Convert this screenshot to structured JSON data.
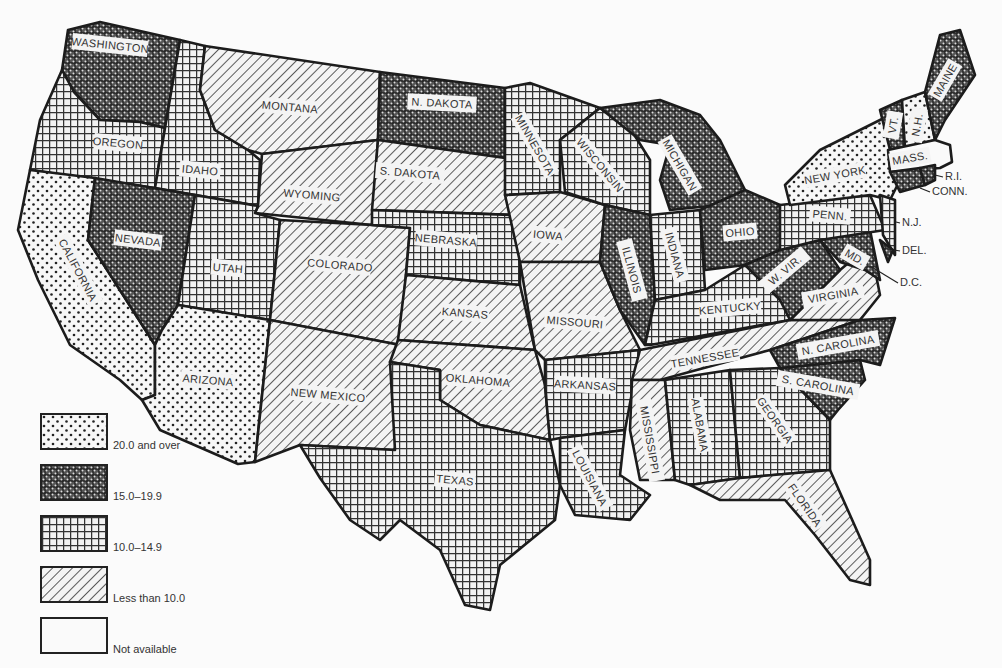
{
  "map": {
    "region": "United States (48 contiguous states + D.C.)",
    "classes": [
      {
        "id": "c20",
        "label": "20.0 and over",
        "pattern": "dots"
      },
      {
        "id": "c15",
        "label": "15.0–19.9",
        "pattern": "dense-crosshatch"
      },
      {
        "id": "c10",
        "label": "10.0–14.9",
        "pattern": "grid"
      },
      {
        "id": "clt10",
        "label": "Less than 10.0",
        "pattern": "diagonal-hatch"
      },
      {
        "id": "cna",
        "label": "Not available",
        "pattern": "blank"
      }
    ],
    "states": [
      {
        "id": "wa",
        "label": "WASHINGTON",
        "class": "c15"
      },
      {
        "id": "or",
        "label": "OREGON",
        "class": "c10"
      },
      {
        "id": "ca",
        "label": "CALIFORNIA",
        "class": "c20"
      },
      {
        "id": "id",
        "label": "IDAHO",
        "class": "c10"
      },
      {
        "id": "nv",
        "label": "NEVADA",
        "class": "c15"
      },
      {
        "id": "mt",
        "label": "MONTANA",
        "class": "clt10"
      },
      {
        "id": "wy",
        "label": "WYOMING",
        "class": "clt10"
      },
      {
        "id": "ut",
        "label": "UTAH",
        "class": "c10"
      },
      {
        "id": "az",
        "label": "ARIZONA",
        "class": "c20"
      },
      {
        "id": "co",
        "label": "COLORADO",
        "class": "clt10"
      },
      {
        "id": "nm",
        "label": "NEW MEXICO",
        "class": "clt10"
      },
      {
        "id": "nd",
        "label": "N. DAKOTA",
        "class": "c15"
      },
      {
        "id": "sd",
        "label": "S. DAKOTA",
        "class": "clt10"
      },
      {
        "id": "ne",
        "label": "NEBRASKA",
        "class": "c10"
      },
      {
        "id": "ks",
        "label": "KANSAS",
        "class": "clt10"
      },
      {
        "id": "ok",
        "label": "OKLAHOMA",
        "class": "clt10"
      },
      {
        "id": "tx",
        "label": "TEXAS",
        "class": "c10"
      },
      {
        "id": "mn",
        "label": "MINNESOTA",
        "class": "c10"
      },
      {
        "id": "ia",
        "label": "IOWA",
        "class": "clt10"
      },
      {
        "id": "mo",
        "label": "MISSOURI",
        "class": "clt10"
      },
      {
        "id": "ar",
        "label": "ARKANSAS",
        "class": "c10"
      },
      {
        "id": "la",
        "label": "LOUISIANA",
        "class": "c10"
      },
      {
        "id": "wi",
        "label": "WISCONSIN",
        "class": "c10"
      },
      {
        "id": "il",
        "label": "ILLINOIS",
        "class": "c15"
      },
      {
        "id": "mi",
        "label": "MICHIGAN",
        "class": "c15"
      },
      {
        "id": "in",
        "label": "INDIANA",
        "class": "c10"
      },
      {
        "id": "oh",
        "label": "OHIO",
        "class": "c15"
      },
      {
        "id": "ky",
        "label": "KENTUCKY",
        "class": "c10"
      },
      {
        "id": "tn",
        "label": "TENNESSEE",
        "class": "clt10"
      },
      {
        "id": "ms",
        "label": "MISSISSIPPI",
        "class": "clt10"
      },
      {
        "id": "al",
        "label": "ALABAMA",
        "class": "c10"
      },
      {
        "id": "ga",
        "label": "GEORGIA",
        "class": "c10"
      },
      {
        "id": "fl",
        "label": "FLORIDA",
        "class": "clt10"
      },
      {
        "id": "sc",
        "label": "S. CAROLINA",
        "class": "c15"
      },
      {
        "id": "nc",
        "label": "N. CAROLINA",
        "class": "c15"
      },
      {
        "id": "va",
        "label": "VIRGINIA",
        "class": "clt10"
      },
      {
        "id": "wv",
        "label": "W. VIR.",
        "class": "c15"
      },
      {
        "id": "md",
        "label": "MD.",
        "class": "c15"
      },
      {
        "id": "pa",
        "label": "PENN.",
        "class": "c10"
      },
      {
        "id": "ny",
        "label": "NEW YORK",
        "class": "c20"
      },
      {
        "id": "nj",
        "label": "N.J.",
        "class": "c10"
      },
      {
        "id": "de",
        "label": "DEL.",
        "class": "c15"
      },
      {
        "id": "dc",
        "label": "D.C.",
        "class": "c15"
      },
      {
        "id": "vt",
        "label": "VT.",
        "class": "c15"
      },
      {
        "id": "nh",
        "label": "N.H.",
        "class": "c20"
      },
      {
        "id": "me",
        "label": "MAINE",
        "class": "c15"
      },
      {
        "id": "ma",
        "label": "MASS.",
        "class": "cna"
      },
      {
        "id": "ct",
        "label": "CONN.",
        "class": "c15"
      },
      {
        "id": "ri",
        "label": "R.I.",
        "class": "c15"
      }
    ],
    "callouts": {
      "ri": "R.I.",
      "ct": "CONN.",
      "nj": "N.J.",
      "de": "DEL.",
      "dc": "D.C."
    }
  }
}
